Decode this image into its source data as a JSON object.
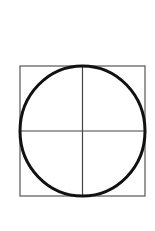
{
  "diagram": {
    "type": "circle-inscribed-in-square",
    "square": {
      "x": 20,
      "y": 66,
      "width": 125,
      "height": 130,
      "stroke": "#555555",
      "stroke_width": 1.2
    },
    "circle": {
      "cx": 82.5,
      "cy": 131,
      "rx": 62.5,
      "ry": 65,
      "stroke": "#111111",
      "stroke_width": 3
    },
    "vertical_line": {
      "x": 82.5,
      "y1": 66,
      "y2": 196,
      "stroke": "#444444"
    },
    "horizontal_line": {
      "y": 131,
      "x1": 20,
      "x2": 145,
      "stroke": "#444444"
    },
    "background": "#ffffff"
  }
}
